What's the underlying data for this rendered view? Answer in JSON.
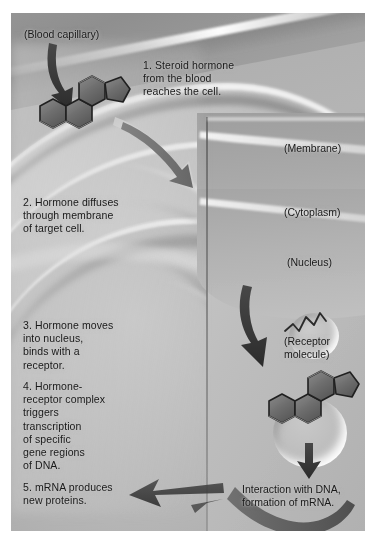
{
  "figure": {
    "style": "grayscale airbrush scientific illustration"
  },
  "steps": [
    {
      "number": "1.",
      "text": "1.  Steroid hormone\nfrom the blood\nreaches the cell."
    },
    {
      "number": "2.",
      "text": "2.  Hormone diffuses\nthrough membrane\nof target cell."
    },
    {
      "number": "3.",
      "text": "3.  Hormone moves\ninto nucleus,\nbinds with a\nreceptor."
    },
    {
      "number": "4.",
      "text": "4.  Hormone-\nreceptor complex\ntriggers\ntranscription\nof specific\ngene regions\nof DNA."
    },
    {
      "number": "5.",
      "text": "5.  mRNA produces\nnew proteins."
    }
  ],
  "labels": {
    "blood_capillary": "(Blood capillary)",
    "membrane": "(Membrane)",
    "cytoplasm": "(Cytoplasm)",
    "nucleus": "(Nucleus)",
    "receptor_molecule": "(Receptor\nmolecule)"
  },
  "captions": {
    "dna_interaction": "Interaction with DNA,\nformation of mRNA."
  },
  "graphics": {
    "molecules": [
      {
        "name": "steroid-hormone-extracellular",
        "description": "four fused rings, three hexagons plus one pentagon, dark grey fill"
      },
      {
        "name": "steroid-hormone-bound",
        "description": "four fused rings bound in receptor pocket inside nucleus"
      }
    ],
    "receptor": {
      "name": "receptor-molecule",
      "description": "zigzag chain resting in a crescent pocket"
    },
    "arrows": [
      {
        "name": "arrow-hormone-to-cell",
        "direction": "down-right"
      },
      {
        "name": "arrow-hormone-through-membrane",
        "direction": "down-right"
      },
      {
        "name": "arrow-hormone-into-nucleus",
        "direction": "down"
      },
      {
        "name": "arrow-complex-to-dna",
        "direction": "down"
      },
      {
        "name": "arrow-mrna-out",
        "direction": "left"
      },
      {
        "name": "arrow-mrna-sweep",
        "direction": "left-curve"
      }
    ]
  },
  "colors": {
    "plate_background": "#b6b6b4",
    "page_background": "#ffffff",
    "text": "#1c1c1c",
    "molecule_fill": "#6e6e6c",
    "molecule_stroke": "#2a2a28",
    "arrow_fill": "#3b3b39"
  }
}
